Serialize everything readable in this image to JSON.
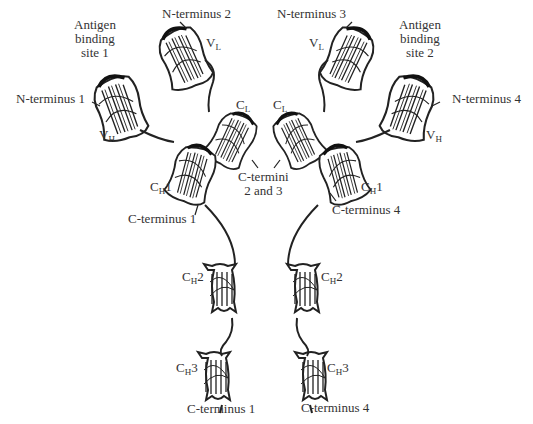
{
  "labels": {
    "antigen_site_1": [
      "Antigen",
      "binding",
      "site 1"
    ],
    "antigen_site_2": [
      "Antigen",
      "binding",
      "site 2"
    ],
    "n_terminus_1": "N-terminus 1",
    "n_terminus_2": "N-terminus 2",
    "n_terminus_3": "N-terminus 3",
    "n_terminus_4": "N-terminus 4",
    "c_termini_2_3": [
      "C-termini",
      "2 and 3"
    ],
    "c_terminus_1_upper": "C-terminus 1",
    "c_terminus_4_upper": "C-terminus 4",
    "c_terminus_1_lower": "C-terminus 1",
    "c_terminus_4_lower": "C-terminus 4"
  },
  "domains": {
    "vl": {
      "base": "V",
      "sub": "L",
      "suffix": ""
    },
    "vh": {
      "base": "V",
      "sub": "H",
      "suffix": ""
    },
    "cl": {
      "base": "C",
      "sub": "L",
      "suffix": ""
    },
    "ch1": {
      "base": "C",
      "sub": "H",
      "suffix": "1"
    },
    "ch2": {
      "base": "C",
      "sub": "H",
      "suffix": "2"
    },
    "ch3": {
      "base": "C",
      "sub": "H",
      "suffix": "3"
    }
  },
  "colors": {
    "ink": "#222222",
    "background": "#ffffff"
  }
}
